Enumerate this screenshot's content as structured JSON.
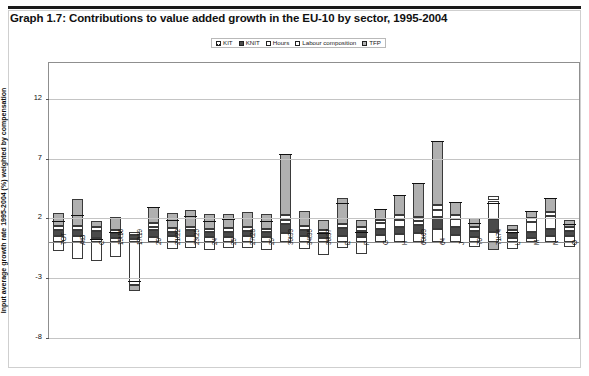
{
  "title": "Graph 1.7: Contributions to value added growth in the EU-10 by sector, 1995-2004",
  "legend": {
    "items": [
      {
        "label": "KIT",
        "key": "kit",
        "color": "#ffffff"
      },
      {
        "label": "KNIT",
        "key": "knit",
        "color": "#4a4a4a"
      },
      {
        "label": "Hours",
        "key": "hours",
        "color": "#ffffff"
      },
      {
        "label": "Labour composition",
        "key": "lc",
        "color": "#ffffff"
      },
      {
        "label": "TFP",
        "key": "tfp",
        "color": "#b0b0b0"
      }
    ]
  },
  "chart_data": {
    "type": "bar",
    "stacked": true,
    "title": "Graph 1.7: Contributions to value added growth in the EU-10 by sector, 1995-2004",
    "xlabel": "",
    "ylabel": "Input average growth rate 1995-2004 (%) weighted by compensation",
    "ylim": [
      -8,
      15
    ],
    "yticks": [
      12,
      7,
      2,
      -3,
      -8
    ],
    "grid": true,
    "legend_position": "top-center",
    "categories": [
      "TOT",
      "AtB",
      "C",
      "15t16",
      "17t19",
      "20",
      "21t22",
      "23t25",
      "24",
      "25",
      "27t28",
      "29",
      "30t33",
      "34t35",
      "36t37",
      "E",
      "F",
      "G",
      "H",
      "60t63",
      "64",
      "J",
      "70",
      "71t74",
      "L",
      "M",
      "N",
      "O"
    ],
    "series": [
      {
        "name": "KIT",
        "values": [
          0.55,
          0.5,
          0.35,
          0.35,
          0.25,
          0.45,
          0.5,
          0.5,
          0.45,
          0.45,
          0.5,
          0.45,
          0.8,
          0.5,
          0.4,
          0.55,
          0.45,
          0.6,
          0.7,
          0.75,
          1.1,
          0.6,
          0.45,
          0.9,
          0.35,
          0.4,
          0.55,
          0.5
        ]
      },
      {
        "name": "KNIT",
        "values": [
          0.45,
          0.55,
          0.6,
          0.4,
          0.35,
          0.55,
          0.4,
          0.5,
          0.4,
          0.45,
          0.45,
          0.4,
          0.75,
          0.55,
          0.35,
          0.65,
          0.5,
          0.55,
          0.6,
          0.7,
          1.05,
          0.65,
          0.5,
          1.05,
          0.4,
          0.45,
          0.6,
          0.45
        ]
      },
      {
        "name": "Hours",
        "values": [
          -0.7,
          -1.4,
          -1.55,
          -1.2,
          -3.6,
          0.3,
          -0.55,
          -0.5,
          -0.6,
          -0.45,
          -0.5,
          -0.6,
          0.35,
          -0.55,
          -1.1,
          -0.45,
          -1.0,
          0.45,
          0.6,
          0.35,
          0.55,
          0.7,
          -0.4,
          1.55,
          -0.55,
          0.85,
          1.05,
          -0.35
        ]
      },
      {
        "name": "Labour composition",
        "values": [
          0.35,
          0.3,
          0.3,
          0.3,
          0.25,
          0.3,
          0.3,
          0.3,
          0.3,
          0.3,
          0.3,
          0.3,
          0.35,
          0.3,
          0.25,
          0.3,
          0.3,
          0.3,
          0.35,
          0.35,
          0.4,
          0.35,
          0.3,
          0.4,
          0.25,
          0.3,
          0.3,
          0.3
        ]
      },
      {
        "name": "TFP",
        "values": [
          1.1,
          2.3,
          0.55,
          1.05,
          -0.45,
          1.35,
          1.25,
          1.4,
          1.25,
          1.2,
          1.3,
          1.25,
          5.1,
          1.25,
          0.85,
          2.25,
          0.6,
          0.9,
          1.75,
          2.85,
          5.4,
          1.05,
          0.75,
          -0.65,
          0.45,
          0.6,
          1.2,
          0.6
        ]
      }
    ],
    "totals": [
      1.75,
      2.25,
      0.25,
      0.9,
      -3.2,
      2.95,
      1.9,
      2.2,
      1.8,
      1.95,
      2.05,
      1.8,
      7.35,
      2.05,
      0.75,
      3.3,
      0.85,
      2.8,
      4.0,
      5.0,
      8.5,
      3.35,
      1.6,
      3.25,
      0.9,
      2.6,
      3.7,
      1.5
    ]
  }
}
